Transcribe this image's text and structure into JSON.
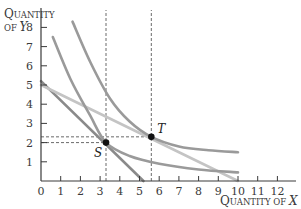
{
  "chart_data": {
    "type": "line",
    "title": "",
    "xlabel": "Quantity of X",
    "ylabel": "Quantity of Y",
    "xlabel_parts": {
      "cap1": "Q",
      "rest": "UANTITY OF ",
      "var": "X"
    },
    "ylabel_parts": {
      "line1_cap": "Q",
      "line1_rest": "UANTITY",
      "line2_pre": "OF ",
      "line2_var": "Y"
    },
    "xlim": [
      0,
      13
    ],
    "ylim": [
      0,
      9
    ],
    "x_ticks": [
      0,
      1,
      2,
      3,
      4,
      5,
      6,
      7,
      8,
      9,
      10,
      11,
      12
    ],
    "y_ticks": [
      1,
      2,
      3,
      4,
      5,
      6,
      7,
      8
    ],
    "grid": false,
    "series": [
      {
        "name": "budget-line-steep",
        "kind": "straight",
        "points": [
          [
            0,
            5.2
          ],
          [
            5.2,
            0
          ]
        ],
        "color": "#8a8a8a"
      },
      {
        "name": "budget-line-flat",
        "kind": "straight",
        "points": [
          [
            0,
            5.0
          ],
          [
            10,
            0
          ]
        ],
        "color": "#c4c4c4"
      },
      {
        "name": "indifference-curve-low",
        "kind": "curve",
        "points": [
          [
            0.6,
            7.5
          ],
          [
            1.5,
            5.3
          ],
          [
            2.5,
            3.4
          ],
          [
            3.3,
            2.0
          ],
          [
            4.5,
            1.3
          ],
          [
            6,
            0.9
          ],
          [
            8,
            0.6
          ],
          [
            10,
            0.45
          ]
        ],
        "color": "#9a9a9a"
      },
      {
        "name": "indifference-curve-high",
        "kind": "curve",
        "points": [
          [
            1.6,
            8.3
          ],
          [
            2.5,
            6.2
          ],
          [
            3.5,
            4.3
          ],
          [
            4.5,
            3.1
          ],
          [
            5.6,
            2.3
          ],
          [
            7,
            1.8
          ],
          [
            8.5,
            1.6
          ],
          [
            10,
            1.5
          ]
        ],
        "color": "#9a9a9a"
      }
    ],
    "points": [
      {
        "label": "S",
        "x": 3.3,
        "y": 2.0
      },
      {
        "label": "T",
        "x": 5.6,
        "y": 2.3
      }
    ],
    "guides": [
      {
        "type": "vertical",
        "x": 3.3,
        "from_y": 0,
        "to_y": 9
      },
      {
        "type": "vertical",
        "x": 5.6,
        "from_y": 0,
        "to_y": 9
      },
      {
        "type": "horizontal",
        "y": 2.0,
        "from_x": 0,
        "to_x": 3.3
      },
      {
        "type": "horizontal",
        "y": 2.3,
        "from_x": 0,
        "to_x": 5.6
      }
    ]
  }
}
